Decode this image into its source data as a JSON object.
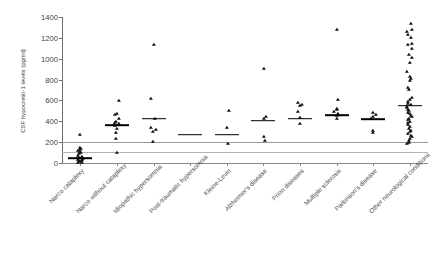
{
  "chart_data": {
    "type": "scatter",
    "title": "",
    "xlabel": "",
    "ylabel": "CSF hypocretin-1 levels (pg/ml)",
    "ylim": [
      0,
      1400
    ],
    "yticks": [
      0,
      200,
      400,
      600,
      800,
      1000,
      1200,
      1400
    ],
    "ytick_labels": [
      "0",
      "200",
      "400",
      "600",
      "800",
      "1000",
      "1200",
      "1400"
    ],
    "grid": false,
    "legend": "none",
    "marker": "triangle",
    "marker_color": "#101010",
    "mean_marker": "horizontal-bar",
    "reference_lines": [
      {
        "name": "upper-cutoff",
        "value": 200,
        "color": "#9a9a9a"
      },
      {
        "name": "lower-cutoff",
        "value": 110,
        "color": "#b4b4b4"
      }
    ],
    "categories": [
      "Narco cataplexy",
      "Narco without cataplexy",
      "Idiopathic hypersomnia",
      "Post-traumatic hypersomnia",
      "Kleine-Levin",
      "Alzheimer's disease",
      "Prion diseases",
      "Multiple sclerosis",
      "Parkinson's disease",
      "Other neurological conditions"
    ],
    "groups": [
      {
        "category": "Narco cataplexy",
        "mean": 45,
        "values": [
          0,
          0,
          10,
          15,
          20,
          25,
          30,
          40,
          45,
          55,
          70,
          85,
          95,
          105,
          115,
          125,
          135,
          140,
          265
        ]
      },
      {
        "category": "Narco without cataplexy",
        "mean": 365,
        "values": [
          100,
          230,
          290,
          330,
          355,
          360,
          370,
          385,
          395,
          420,
          465,
          470,
          595
        ]
      },
      {
        "category": "Idiopathic hypersomnia",
        "mean": 425,
        "values": [
          200,
          300,
          320,
          335,
          420,
          615,
          1135
        ]
      },
      {
        "category": "Post-traumatic hypersomnia",
        "mean": 270,
        "values": []
      },
      {
        "category": "Kleine-Levin",
        "mean": 270,
        "values": [
          180,
          335,
          495
        ]
      },
      {
        "category": "Alzheimer's disease",
        "mean": 405,
        "values": [
          215,
          250,
          420,
          445,
          900
        ]
      },
      {
        "category": "Prion diseases",
        "mean": 425,
        "values": [
          370,
          430,
          490,
          545,
          560,
          575
        ]
      },
      {
        "category": "Multiple sclerosis",
        "mean": 460,
        "values": [
          420,
          450,
          470,
          490,
          505,
          520,
          600,
          1280
        ]
      },
      {
        "category": "Parkinson's disease",
        "mean": 420,
        "values": [
          290,
          310,
          420,
          445,
          465,
          480
        ]
      },
      {
        "category": "Other neurological conditions",
        "mean": 550,
        "values": [
          180,
          195,
          215,
          230,
          245,
          260,
          275,
          295,
          310,
          330,
          350,
          365,
          380,
          395,
          410,
          425,
          440,
          455,
          470,
          480,
          495,
          510,
          525,
          540,
          555,
          570,
          585,
          600,
          620,
          700,
          715,
          790,
          805,
          820,
          870,
          960,
          1010,
          1040,
          1090,
          1130,
          1140,
          1200,
          1230,
          1255,
          1280,
          1330
        ]
      }
    ]
  }
}
